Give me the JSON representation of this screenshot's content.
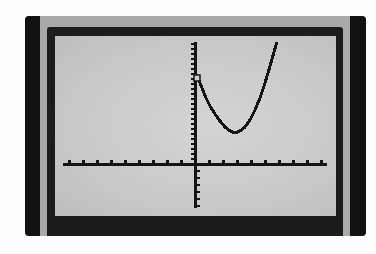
{
  "device": {
    "type": "graphing-calculator-screen",
    "screen_mode": "graph"
  },
  "colors": {
    "bezel_dark": "#121212",
    "bezel_gray": "#a9a9a9",
    "inner_frame": "#1c1c1c",
    "lcd_background": "#cccccc",
    "pixel_ink": "#141414"
  },
  "chart_data": {
    "type": "line",
    "title": "",
    "xlabel": "",
    "ylabel": "",
    "grid": false,
    "legend": null,
    "axes": {
      "x_axis_visible": true,
      "y_axis_visible": true,
      "tick_labels": false,
      "x_tick_count_left_of_origin": 9,
      "x_tick_count_right_of_origin": 9,
      "y_tick_spacing_px_above": 5,
      "y_tick_spacing_px_below": 7
    },
    "series": [
      {
        "name": "parabola",
        "shape": "upward-opening parabola, drawn only for x >= 0",
        "equation_visible": false,
        "note": "No equation, window settings, or labels appear on screen. Points are traced from pixel positions in the screenshot, not from a known function.",
        "screen_points_px": [
          [
            198,
            78
          ],
          [
            202,
            88
          ],
          [
            206,
            98
          ],
          [
            210,
            106
          ],
          [
            215,
            114
          ],
          [
            220,
            121
          ],
          [
            225,
            127
          ],
          [
            230,
            131
          ],
          [
            235,
            133
          ],
          [
            240,
            131
          ],
          [
            245,
            127
          ],
          [
            250,
            120
          ],
          [
            255,
            110
          ],
          [
            260,
            98
          ],
          [
            265,
            83
          ],
          [
            270,
            66
          ],
          [
            274,
            52
          ],
          [
            277,
            42
          ]
        ],
        "marker": {
          "type": "open-square",
          "at_px": [
            197,
            78
          ],
          "meaning": "marker at the curve's y-intercept"
        }
      }
    ],
    "layout_px": {
      "origin": [
        195,
        164
      ],
      "x_axis_range_px": [
        63,
        327
      ],
      "y_axis_range_px": [
        42,
        208
      ],
      "vertex_px": [
        235,
        133
      ]
    }
  }
}
